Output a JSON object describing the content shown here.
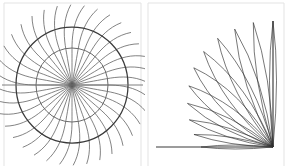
{
  "figure": {
    "background_color": "#ffffff",
    "width": 289,
    "height": 168,
    "panel_border_color": "#e3e3e3",
    "panel_count": 2
  },
  "left_panel": {
    "name": "radial-rose-panel",
    "description": "Concentric circles crossed by curved radial spokes",
    "center_x": 72,
    "center_y": 85,
    "spoke_count": 36,
    "spoke_color": "#5a5a5a",
    "spoke_inner_radius": 0,
    "spoke_outer_radius": 78,
    "spoke_curvature": 0.22,
    "rings": [
      {
        "label": "outer-ring",
        "radius_x": 56,
        "radius_y": 58,
        "color": "#3a3a3a",
        "stroke_width": 1.25
      },
      {
        "label": "inner-ring",
        "radius_x": 36,
        "radius_y": 37,
        "color": "#6b6b6b",
        "stroke_width": 1.0
      }
    ],
    "axis": {
      "label": "horizontal-diameter",
      "x1": 2,
      "x2": 143,
      "y": 85,
      "color": "#6f6f6f"
    }
  },
  "right_panel": {
    "name": "spindle-fan-panel",
    "description": "Quarter fan of narrow spindle loops converging at the bottom-right apex",
    "apex_x": 128,
    "apex_y": 147,
    "petal_count": 11,
    "petal_color": "#2f2f2f",
    "petal_bulge": 0.16,
    "angle_start_deg": 180,
    "angle_end_deg": 90,
    "radii": [
      72,
      80,
      88,
      96,
      104,
      112,
      118,
      122,
      124,
      126,
      126
    ],
    "baseline": {
      "label": "horizontal-baseline",
      "x1": 11,
      "x2": 128,
      "y": 147,
      "color": "#3a3a3a"
    },
    "vertical_ray": {
      "label": "vertical-ray",
      "x": 128,
      "y1": 147,
      "y2": 21,
      "color": "#2f2f2f"
    }
  },
  "chart_data": {
    "type": "line",
    "xlabel": "",
    "ylabel": "",
    "grid": false,
    "legend": "none",
    "panels": [
      {
        "name": "radial-rose",
        "type": "polar-line",
        "series": [
          {
            "name": "radial-spokes",
            "count": 36,
            "theta_step_deg": 10,
            "r_min": 0,
            "r_max": 78,
            "color": "#5a5a5a"
          },
          {
            "name": "outer-circle",
            "r": 57,
            "color": "#3a3a3a"
          },
          {
            "name": "inner-circle",
            "r": 36,
            "color": "#6b6b6b"
          },
          {
            "name": "horizontal-diameter",
            "theta_deg": [
              0,
              180
            ],
            "r": 71,
            "color": "#6f6f6f"
          }
        ]
      },
      {
        "name": "spindle-fan",
        "type": "polar-line",
        "series": [
          {
            "name": "spindle-loops",
            "count": 11,
            "theta_start_deg": 180,
            "theta_end_deg": 90,
            "r_values": [
              72,
              80,
              88,
              96,
              104,
              112,
              118,
              122,
              124,
              126,
              126
            ],
            "color": "#2f2f2f"
          },
          {
            "name": "baseline",
            "theta_deg": 180,
            "r": 117,
            "color": "#3a3a3a"
          },
          {
            "name": "vertical-ray",
            "theta_deg": 90,
            "r": 126,
            "color": "#2f2f2f"
          }
        ]
      }
    ]
  }
}
